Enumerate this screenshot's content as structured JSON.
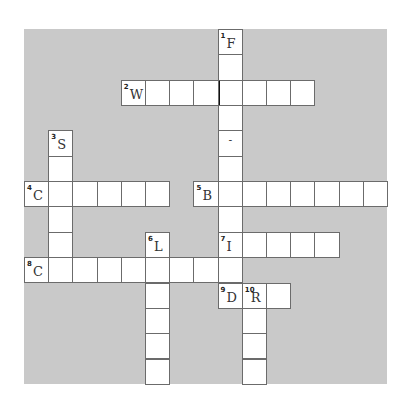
{
  "puzzle": {
    "grid": {
      "cols": 15,
      "rows": 14,
      "background_color": "#c9c9c9",
      "cell_color": "#ffffff",
      "border_color": "#6b6b6b"
    },
    "entries": [
      {
        "number": 1,
        "direction": "down",
        "row": 0,
        "col": 8,
        "length": 11,
        "first_letter": "F"
      },
      {
        "number": 2,
        "direction": "across",
        "row": 2,
        "col": 4,
        "length": 8,
        "first_letter": "W"
      },
      {
        "number": 3,
        "direction": "down",
        "row": 4,
        "col": 1,
        "length": 6,
        "first_letter": "S"
      },
      {
        "number": 4,
        "direction": "across",
        "row": 6,
        "col": 0,
        "length": 6,
        "first_letter": "C"
      },
      {
        "number": 5,
        "direction": "across",
        "row": 6,
        "col": 7,
        "length": 8,
        "first_letter": "B"
      },
      {
        "number": 6,
        "direction": "down",
        "row": 8,
        "col": 5,
        "length": 6,
        "first_letter": "L"
      },
      {
        "number": 7,
        "direction": "across",
        "row": 8,
        "col": 8,
        "length": 5,
        "first_letter": "I"
      },
      {
        "number": 8,
        "direction": "across",
        "row": 9,
        "col": 0,
        "length": 9,
        "first_letter": "C"
      },
      {
        "number": 9,
        "direction": "across",
        "row": 10,
        "col": 8,
        "length": 3,
        "first_letter": "D"
      },
      {
        "number": 10,
        "direction": "down",
        "row": 10,
        "col": 9,
        "length": 4,
        "first_letter": "R"
      }
    ],
    "prefilled": [
      {
        "row": 4,
        "col": 8,
        "char": "-"
      }
    ],
    "thick_divider": {
      "row": 2,
      "col": 8,
      "side": "left"
    }
  }
}
